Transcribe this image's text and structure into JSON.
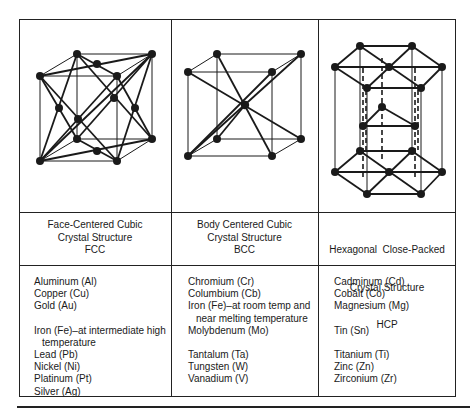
{
  "columns": [
    {
      "id": "fcc",
      "diagram_icon": "fcc-unit-cell-icon",
      "caption": [
        "Face-Centered Cubic",
        "Crystal Structure",
        "FCC"
      ],
      "groups": [
        [
          "Aluminum (Al)",
          "Copper (Cu)",
          "Gold (Au)"
        ],
        [
          "Iron (Fe)–at intermediate high",
          "  temperature",
          "Lead (Pb)",
          "Nickel (Ni)",
          "Platinum (Pt)",
          "Silver (Ag)"
        ]
      ]
    },
    {
      "id": "bcc",
      "diagram_icon": "bcc-unit-cell-icon",
      "caption": [
        "Body Centered Cubic",
        "Crystal Structure",
        "BCC"
      ],
      "groups": [
        [
          "Chromium (Cr)",
          "Columbium (Cb)",
          "Iron (Fe)–at room temp and",
          "  near melting temperature",
          "Molybdenum (Mo)"
        ],
        [
          "Tantalum (Ta)",
          "Tungsten (W)",
          "Vanadium (V)"
        ]
      ]
    },
    {
      "id": "hcp",
      "diagram_icon": "hcp-unit-cell-icon",
      "caption": [
        "Hexagonal  Close-Packed",
        "Crystal Structure",
        "HCP"
      ],
      "groups": [
        [
          "Cadminum (Cd)",
          "Cobalt (Co)",
          "Magnesium (Mg)"
        ],
        [
          "Tin (Sn)"
        ],
        [
          "Titanium (Ti)",
          "Zinc (Zn)",
          "Zirconium (Zr)"
        ]
      ]
    }
  ],
  "colors": {
    "ink": "#1a1a1a",
    "background": "#ffffff"
  }
}
